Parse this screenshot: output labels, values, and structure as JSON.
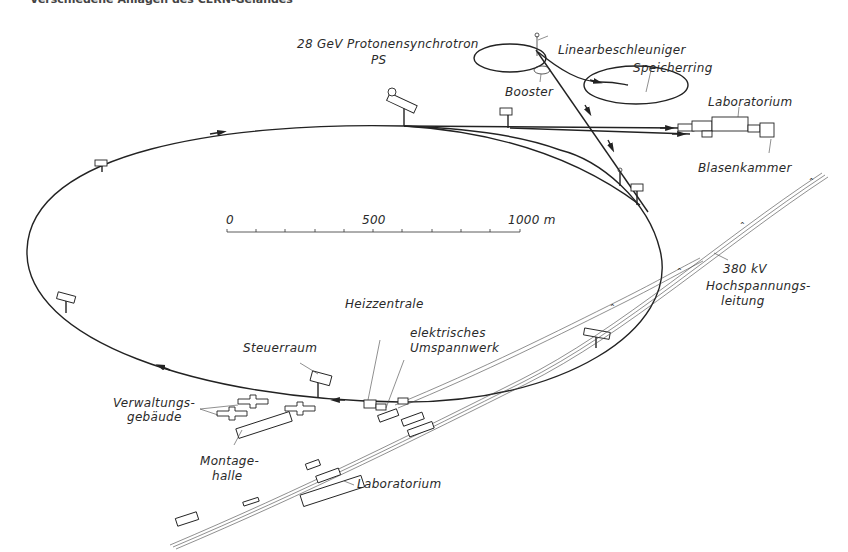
{
  "caption": "Verschiedene Anlagen des CERN-Geländes",
  "labels": {
    "ps_line1": "28 GeV  Protonensynchrotron",
    "ps_line2": "PS",
    "linac": "Linearbeschleuniger",
    "booster": "Booster",
    "storage_ring": "Speicherring",
    "lab_top": "Laboratorium",
    "bubble_chamber": "Blasenkammer",
    "power_line_1": "380 kV",
    "power_line_2": "Hochspannungs-",
    "power_line_3": "leitung",
    "heating": "Heizzentrale",
    "substation_1": "elektrisches",
    "substation_2": "Umspannwerk",
    "control_room": "Steuerraum",
    "admin_1": "Verwaltungs-",
    "admin_2": "gebäude",
    "assembly_1": "Montage-",
    "assembly_2": "halle",
    "lab_bottom": "Laboratorium"
  },
  "scale_bar": {
    "start": "0",
    "mid": "500",
    "end": "1000  m",
    "segments": 10
  },
  "colors": {
    "ink": "#222222",
    "background": "#ffffff"
  }
}
